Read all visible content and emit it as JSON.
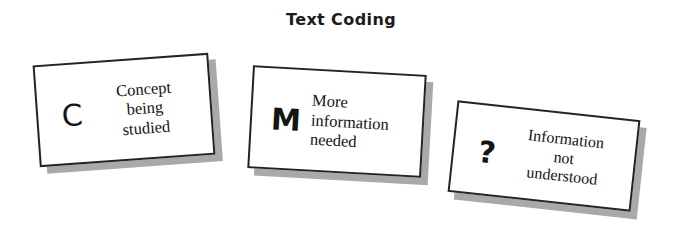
{
  "page": {
    "title": "Text Coding",
    "background_color": "#ffffff",
    "width": 682,
    "height": 231
  },
  "style": {
    "card_fill": "#ffffff",
    "card_border_color": "#23232b",
    "card_shadow_color": "#a9a9a9",
    "text_color": "#131313"
  },
  "cards": [
    {
      "code": "C",
      "name": "concept",
      "lines": [
        "Concept",
        "being",
        "studied"
      ],
      "meaning": "Concept being studied"
    },
    {
      "code": "M",
      "name": "more-information",
      "lines": [
        "More",
        "information",
        "needed"
      ],
      "meaning": "More information needed"
    },
    {
      "code": "?",
      "name": "not-understood",
      "lines": [
        "Information",
        "not",
        "understood"
      ],
      "meaning": "Information not understood"
    }
  ]
}
